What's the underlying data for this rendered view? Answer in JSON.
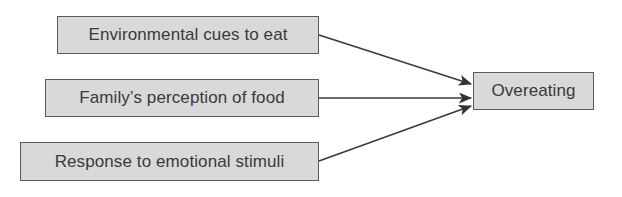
{
  "diagram": {
    "type": "flow",
    "nodes": [
      {
        "id": "n1",
        "label": "Environmental cues to eat"
      },
      {
        "id": "n2",
        "label": "Family’s perception of food"
      },
      {
        "id": "n3",
        "label": "Response to emotional stimuli"
      },
      {
        "id": "n4",
        "label": "Overeating"
      }
    ],
    "edges": [
      {
        "from": "n1",
        "to": "n4"
      },
      {
        "from": "n2",
        "to": "n4"
      },
      {
        "from": "n3",
        "to": "n4"
      }
    ],
    "colors": {
      "box_fill": "#d9d9d9",
      "box_border": "#5a5a5a",
      "arrow": "#3a3a3a",
      "text": "#3a3a3a"
    }
  }
}
